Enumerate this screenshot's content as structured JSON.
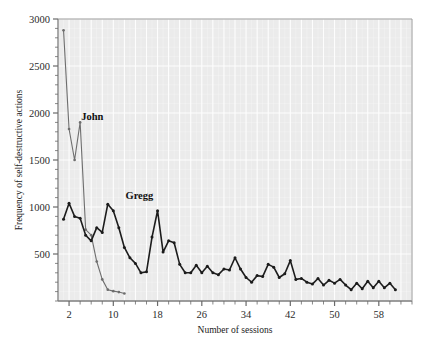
{
  "chart_data": {
    "type": "line",
    "title": "",
    "xlabel": "Number of sessions",
    "ylabel": "Frequency of self-destructive actions",
    "xlim": [
      0,
      64
    ],
    "ylim": [
      0,
      3000
    ],
    "xticks": [
      2,
      10,
      18,
      26,
      34,
      42,
      50,
      58
    ],
    "xtick_labels": [
      "2",
      "10",
      "18",
      "26",
      "34",
      "42",
      "50",
      "58"
    ],
    "xminor_step": 2,
    "yticks": [
      500,
      1000,
      1500,
      2000,
      2500,
      3000
    ],
    "ytick_labels": [
      "500",
      "1000",
      "1500",
      "2000",
      "2500",
      "3000"
    ],
    "yminor_step": 100,
    "grid": true,
    "grid_color": "#ffffff",
    "plot_background": "#ebebeb",
    "legend_position": "inline-annotations",
    "annotations": [
      {
        "text": "John",
        "x": 4.2,
        "y": 1930,
        "color": "#111111"
      },
      {
        "text": "Gregg",
        "x": 12.2,
        "y": 1080,
        "color": "#111111"
      }
    ],
    "series": [
      {
        "name": "John",
        "color": "#6e6e6e",
        "line_width": 1.1,
        "marker": "dot",
        "x": [
          1,
          2,
          3,
          4,
          5,
          6,
          7,
          8,
          9,
          10,
          11,
          12
        ],
        "values": [
          2880,
          1830,
          1500,
          1900,
          760,
          700,
          420,
          230,
          120,
          105,
          95,
          80
        ]
      },
      {
        "name": "Gregg",
        "color": "#1c1c1c",
        "line_width": 1.6,
        "marker": "dot",
        "x": [
          1,
          2,
          3,
          4,
          5,
          6,
          7,
          8,
          9,
          10,
          11,
          12,
          13,
          14,
          15,
          16,
          17,
          18,
          19,
          20,
          21,
          22,
          23,
          24,
          25,
          26,
          27,
          28,
          29,
          30,
          31,
          32,
          33,
          34,
          35,
          36,
          37,
          38,
          39,
          40,
          41,
          42,
          43,
          44,
          45,
          46,
          47,
          48,
          49,
          50,
          51,
          52,
          53,
          54,
          55,
          56,
          57,
          58,
          59,
          60,
          61
        ],
        "values": [
          870,
          1040,
          900,
          880,
          700,
          640,
          780,
          730,
          1030,
          960,
          780,
          570,
          460,
          400,
          300,
          310,
          680,
          960,
          520,
          640,
          620,
          390,
          300,
          300,
          380,
          300,
          370,
          300,
          280,
          340,
          330,
          460,
          340,
          250,
          200,
          270,
          260,
          390,
          360,
          250,
          290,
          430,
          230,
          240,
          200,
          180,
          240,
          170,
          220,
          190,
          230,
          170,
          120,
          190,
          130,
          210,
          140,
          210,
          140,
          190,
          120
        ]
      }
    ]
  },
  "plot_geometry": {
    "left": 58,
    "right": 412,
    "top": 19,
    "bottom": 301
  }
}
